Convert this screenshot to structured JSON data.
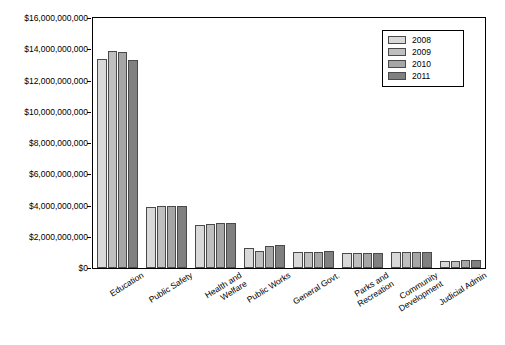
{
  "chart_data": {
    "type": "bar",
    "title": "",
    "xlabel": "",
    "ylabel": "",
    "ylim": [
      0,
      16000000000
    ],
    "grid": false,
    "legend_position": "top-right",
    "ytick_labels": [
      "$16,000,000,000",
      "$14,000,000,000",
      "$12,000,000,000",
      "$10,000,000,000",
      "$8,000,000,000",
      "$6,000,000,000",
      "$4,000,000,000",
      "$2,000,000,000",
      "$0"
    ],
    "ytick_values": [
      16000000000,
      14000000000,
      12000000000,
      10000000000,
      8000000000,
      6000000000,
      4000000000,
      2000000000,
      0
    ],
    "categories": [
      "Education",
      "Public Safety",
      "Health and\nWelfare",
      "Public Works",
      "General Govt.",
      "Parks and\nRecreation",
      "Community\nDevelopment",
      "Judicial Admin"
    ],
    "series": [
      {
        "name": "2008",
        "color": "#d9d9d9",
        "values": [
          13400000000,
          3900000000,
          2750000000,
          1300000000,
          1000000000,
          950000000,
          1000000000,
          450000000
        ]
      },
      {
        "name": "2009",
        "color": "#bfbfbf",
        "values": [
          13900000000,
          3950000000,
          2800000000,
          1100000000,
          1000000000,
          950000000,
          1050000000,
          450000000
        ]
      },
      {
        "name": "2010",
        "color": "#a6a6a6",
        "values": [
          13800000000,
          4000000000,
          2900000000,
          1400000000,
          1050000000,
          950000000,
          1000000000,
          500000000
        ]
      },
      {
        "name": "2011",
        "color": "#808080",
        "values": [
          13300000000,
          4000000000,
          2900000000,
          1450000000,
          1100000000,
          950000000,
          1000000000,
          500000000
        ]
      }
    ]
  }
}
